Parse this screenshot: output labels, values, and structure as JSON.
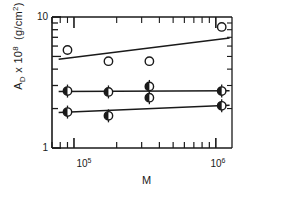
{
  "chart_data": {
    "type": "scatter",
    "title": "",
    "xlabel": "M",
    "ylabel": "A_D x 10^8  (g/cm2)",
    "ylabel_parts": {
      "symbol": "A",
      "subscript": "D",
      "times": " x 10",
      "exponent": "8",
      "units": "(g/cm",
      "units_exponent": "2",
      "units_close": ")"
    },
    "xscale": "log",
    "yscale": "log",
    "xlim": [
      70000,
      1300000
    ],
    "ylim": [
      1,
      10
    ],
    "grid": false,
    "legend": "none",
    "xticks_major": [
      100000,
      1000000
    ],
    "xtick_labels": [
      "10⁵",
      "10⁶"
    ],
    "yticks_major": [
      1,
      10
    ],
    "ytick_labels": [
      "1",
      "10"
    ],
    "series": [
      {
        "name": "open-circles-upper",
        "marker": "open-circle",
        "points": [
          {
            "x": 90000,
            "y": 5.6
          },
          {
            "x": 175000,
            "y": 4.6
          },
          {
            "x": 340000,
            "y": 4.6
          },
          {
            "x": 1100000,
            "y": 8.4
          }
        ],
        "fit_line": {
          "x1": 78000,
          "y1": 4.75,
          "x2": 1250000,
          "y2": 6.9
        }
      },
      {
        "name": "half-filled-circles-middle",
        "marker": "half-filled-circle-errorbar",
        "points": [
          {
            "x": 90000,
            "y": 2.72
          },
          {
            "x": 175000,
            "y": 2.68
          },
          {
            "x": 340000,
            "y": 2.95
          },
          {
            "x": 340000,
            "y": 2.42
          },
          {
            "x": 1100000,
            "y": 2.72
          }
        ],
        "fit_line": {
          "x1": 78000,
          "y1": 2.7,
          "x2": 1250000,
          "y2": 2.74
        }
      },
      {
        "name": "half-filled-circles-lower",
        "marker": "half-filled-circle-errorbar",
        "points": [
          {
            "x": 90000,
            "y": 1.88
          },
          {
            "x": 175000,
            "y": 1.76
          },
          {
            "x": 1100000,
            "y": 2.1
          }
        ],
        "fit_line": {
          "x1": 78000,
          "y1": 1.87,
          "x2": 1250000,
          "y2": 2.12
        }
      }
    ],
    "colors": {
      "axis": "#1a1a1a",
      "marker_stroke": "#1a1a1a",
      "marker_fill_open": "#ffffff",
      "marker_fill_half": "#1a1a1a",
      "line": "#1a1a1a"
    }
  },
  "axes": {
    "y_top_label": "10",
    "y_bottom_label": "1",
    "x_left_label": "10",
    "x_left_exp": "5",
    "x_right_label": "10",
    "x_right_exp": "6",
    "x_title": "M"
  }
}
